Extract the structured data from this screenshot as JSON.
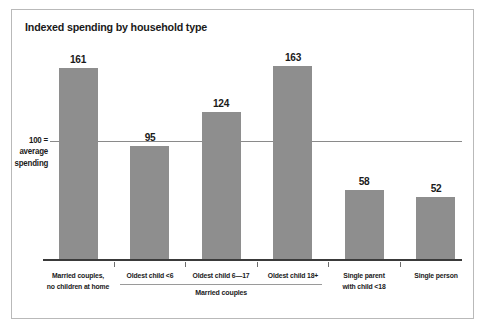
{
  "chart_data": {
    "type": "bar",
    "title": "Indexed spending by household type",
    "xlabel": "",
    "ylabel": "",
    "ylim": [
      0,
      175
    ],
    "grid": false,
    "legend": "none",
    "categories": [
      "Married couples,\nno children at home",
      "Oldest child <6",
      "Oldest child 6—17",
      "Oldest child 18+",
      "Single parent\nwith child <18",
      "Single person"
    ],
    "category_lines": [
      [
        "Married couples,",
        "no children at home"
      ],
      [
        "Oldest child <6"
      ],
      [
        "Oldest child 6—17"
      ],
      [
        "Oldest child 18+"
      ],
      [
        "Single parent",
        "with child <18"
      ],
      [
        "Single person"
      ]
    ],
    "values": [
      161,
      95,
      124,
      163,
      58,
      52
    ],
    "value_labels": [
      "161",
      "95",
      "124",
      "163",
      "58",
      "52"
    ],
    "reference_line": {
      "value": 100,
      "label_lines": [
        "100 =",
        "average",
        "spending"
      ]
    },
    "group_bracket": {
      "label": "Married couples",
      "covers_categories": [
        1,
        2,
        3
      ]
    },
    "colors": {
      "bar": "#8e8e8e",
      "axis": "#3a3a3a",
      "reference_line": "#8a8a8a",
      "text": "#1a1a1a",
      "frame": "#b9b9b9",
      "background": "#ffffff"
    }
  }
}
